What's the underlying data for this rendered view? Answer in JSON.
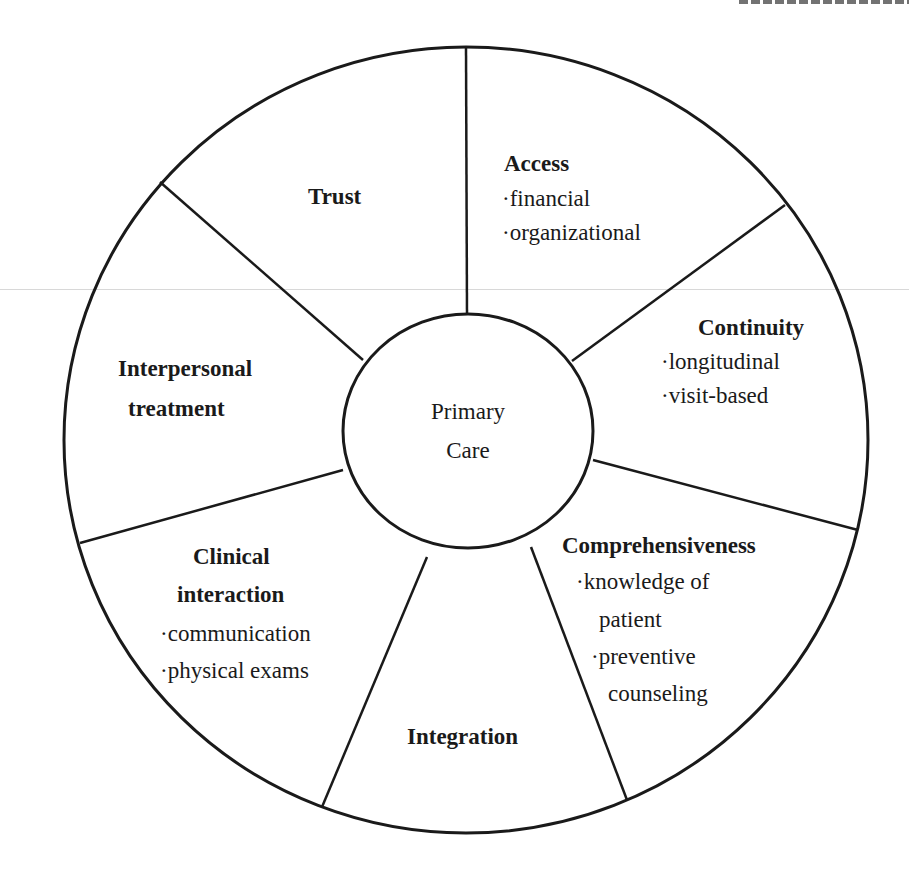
{
  "diagram": {
    "type": "wheel",
    "center": {
      "line1": "Primary",
      "line2": "Care"
    },
    "segments": [
      {
        "title": "Access",
        "items": [
          "financial",
          "organizational"
        ]
      },
      {
        "title": "Continuity",
        "items": [
          "longitudinal",
          "visit-based"
        ]
      },
      {
        "title": "Comprehensiveness",
        "items": [
          "knowledge of",
          "patient",
          "preventive",
          "counseling"
        ]
      },
      {
        "title": "Integration",
        "items": []
      },
      {
        "title_line1": "Clinical",
        "title_line2": "interaction",
        "items": [
          "communication",
          "physical exams"
        ]
      },
      {
        "title_line1": "Interpersonal",
        "title_line2": "treatment",
        "items": []
      },
      {
        "title": "Trust",
        "items": []
      }
    ],
    "bullet": "·",
    "colors": {
      "stroke": "#1a1a1a",
      "background": "#ffffff"
    }
  }
}
